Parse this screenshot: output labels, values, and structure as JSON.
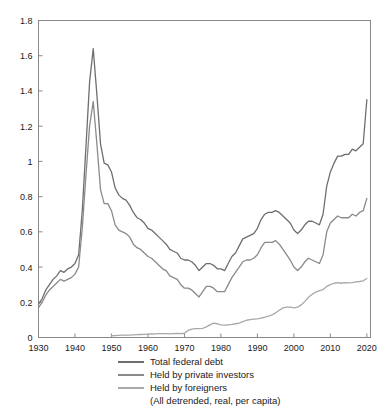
{
  "chart_data": {
    "type": "line",
    "title": "",
    "subtitle": "",
    "xlabel": "",
    "ylabel": "",
    "xlim": [
      1930,
      2021
    ],
    "ylim": [
      0,
      1.8
    ],
    "grid": false,
    "legend_position": "bottom",
    "xticks": [
      1930,
      1940,
      1950,
      1960,
      1970,
      1980,
      1990,
      2000,
      2010,
      2020
    ],
    "xtick_labels": [
      "1930",
      "1940",
      "1950",
      "1960",
      "1970",
      "1980",
      "1990",
      "2000",
      "2010",
      "2020"
    ],
    "yticks": [
      0,
      0.2,
      0.4,
      0.6,
      0.8,
      1,
      1.2,
      1.4,
      1.6,
      1.8
    ],
    "ytick_labels": [
      "0",
      "0.2",
      "0.4",
      "0.6",
      "0.8",
      "1",
      "1.2",
      "1.4",
      "1.6",
      "1.8"
    ],
    "annotation": "(All detrended, real, per capita)",
    "series": [
      {
        "name": "Total federal debt",
        "color": "#6e6e6e",
        "x": [
          1930,
          1931,
          1932,
          1933,
          1934,
          1935,
          1936,
          1937,
          1938,
          1939,
          1940,
          1941,
          1942,
          1943,
          1944,
          1945,
          1946,
          1947,
          1948,
          1949,
          1950,
          1951,
          1952,
          1953,
          1954,
          1955,
          1956,
          1957,
          1958,
          1959,
          1960,
          1961,
          1962,
          1963,
          1964,
          1965,
          1966,
          1967,
          1968,
          1969,
          1970,
          1971,
          1972,
          1973,
          1974,
          1975,
          1976,
          1977,
          1978,
          1979,
          1980,
          1981,
          1982,
          1983,
          1984,
          1985,
          1986,
          1987,
          1988,
          1989,
          1990,
          1991,
          1992,
          1993,
          1994,
          1995,
          1996,
          1997,
          1998,
          1999,
          2000,
          2001,
          2002,
          2003,
          2004,
          2005,
          2006,
          2007,
          2008,
          2009,
          2010,
          2011,
          2012,
          2013,
          2014,
          2015,
          2016,
          2017,
          2018,
          2019,
          2020
        ],
        "values": [
          0.19,
          0.22,
          0.27,
          0.3,
          0.33,
          0.35,
          0.38,
          0.37,
          0.39,
          0.4,
          0.42,
          0.47,
          0.72,
          1.08,
          1.45,
          1.64,
          1.38,
          1.1,
          0.99,
          0.98,
          0.94,
          0.85,
          0.81,
          0.79,
          0.78,
          0.75,
          0.71,
          0.68,
          0.67,
          0.65,
          0.62,
          0.61,
          0.59,
          0.57,
          0.55,
          0.53,
          0.5,
          0.49,
          0.48,
          0.45,
          0.44,
          0.44,
          0.43,
          0.41,
          0.38,
          0.4,
          0.42,
          0.42,
          0.41,
          0.39,
          0.39,
          0.38,
          0.42,
          0.46,
          0.48,
          0.52,
          0.56,
          0.57,
          0.58,
          0.59,
          0.62,
          0.67,
          0.7,
          0.71,
          0.71,
          0.72,
          0.71,
          0.69,
          0.67,
          0.65,
          0.61,
          0.59,
          0.61,
          0.64,
          0.66,
          0.66,
          0.65,
          0.64,
          0.7,
          0.86,
          0.94,
          0.99,
          1.03,
          1.03,
          1.04,
          1.04,
          1.07,
          1.06,
          1.08,
          1.1,
          1.35
        ]
      },
      {
        "name": "Held by private investors",
        "color": "#8a8a8a",
        "x": [
          1930,
          1931,
          1932,
          1933,
          1934,
          1935,
          1936,
          1937,
          1938,
          1939,
          1940,
          1941,
          1942,
          1943,
          1944,
          1945,
          1946,
          1947,
          1948,
          1949,
          1950,
          1951,
          1952,
          1953,
          1954,
          1955,
          1956,
          1957,
          1958,
          1959,
          1960,
          1961,
          1962,
          1963,
          1964,
          1965,
          1966,
          1967,
          1968,
          1969,
          1970,
          1971,
          1972,
          1973,
          1974,
          1975,
          1976,
          1977,
          1978,
          1979,
          1980,
          1981,
          1982,
          1983,
          1984,
          1985,
          1986,
          1987,
          1988,
          1989,
          1990,
          1991,
          1992,
          1993,
          1994,
          1995,
          1996,
          1997,
          1998,
          1999,
          2000,
          2001,
          2002,
          2003,
          2004,
          2005,
          2006,
          2007,
          2008,
          2009,
          2010,
          2011,
          2012,
          2013,
          2014,
          2015,
          2016,
          2017,
          2018,
          2019,
          2020
        ],
        "values": [
          0.17,
          0.2,
          0.24,
          0.27,
          0.29,
          0.31,
          0.33,
          0.32,
          0.33,
          0.34,
          0.36,
          0.4,
          0.62,
          0.92,
          1.2,
          1.34,
          1.1,
          0.84,
          0.76,
          0.76,
          0.72,
          0.64,
          0.61,
          0.6,
          0.59,
          0.57,
          0.53,
          0.51,
          0.5,
          0.48,
          0.46,
          0.45,
          0.43,
          0.41,
          0.39,
          0.38,
          0.35,
          0.34,
          0.33,
          0.3,
          0.28,
          0.28,
          0.27,
          0.25,
          0.23,
          0.26,
          0.29,
          0.29,
          0.28,
          0.26,
          0.26,
          0.26,
          0.3,
          0.34,
          0.37,
          0.4,
          0.43,
          0.44,
          0.44,
          0.45,
          0.47,
          0.51,
          0.54,
          0.54,
          0.54,
          0.55,
          0.53,
          0.5,
          0.47,
          0.44,
          0.4,
          0.38,
          0.4,
          0.43,
          0.45,
          0.44,
          0.43,
          0.42,
          0.47,
          0.6,
          0.65,
          0.67,
          0.69,
          0.68,
          0.68,
          0.68,
          0.7,
          0.69,
          0.71,
          0.72,
          0.79
        ]
      },
      {
        "name": "Held by foreigners",
        "color": "#a8a8a8",
        "x": [
          1950,
          1951,
          1952,
          1953,
          1954,
          1955,
          1956,
          1957,
          1958,
          1959,
          1960,
          1961,
          1962,
          1963,
          1964,
          1965,
          1966,
          1967,
          1968,
          1969,
          1970,
          1971,
          1972,
          1973,
          1974,
          1975,
          1976,
          1977,
          1978,
          1979,
          1980,
          1981,
          1982,
          1983,
          1984,
          1985,
          1986,
          1987,
          1988,
          1989,
          1990,
          1991,
          1992,
          1993,
          1994,
          1995,
          1996,
          1997,
          1998,
          1999,
          2000,
          2001,
          2002,
          2003,
          2004,
          2005,
          2006,
          2007,
          2008,
          2009,
          2010,
          2011,
          2012,
          2013,
          2014,
          2015,
          2016,
          2017,
          2018,
          2019,
          2020
        ],
        "values": [
          0.01,
          0.011,
          0.012,
          0.013,
          0.014,
          0.014,
          0.015,
          0.016,
          0.017,
          0.018,
          0.019,
          0.02,
          0.021,
          0.022,
          0.022,
          0.022,
          0.021,
          0.022,
          0.023,
          0.022,
          0.024,
          0.04,
          0.048,
          0.05,
          0.05,
          0.052,
          0.06,
          0.072,
          0.082,
          0.078,
          0.072,
          0.07,
          0.072,
          0.074,
          0.078,
          0.082,
          0.09,
          0.098,
          0.102,
          0.104,
          0.106,
          0.11,
          0.115,
          0.122,
          0.128,
          0.14,
          0.155,
          0.168,
          0.172,
          0.172,
          0.168,
          0.172,
          0.185,
          0.205,
          0.228,
          0.245,
          0.258,
          0.266,
          0.272,
          0.29,
          0.3,
          0.308,
          0.312,
          0.308,
          0.312,
          0.31,
          0.312,
          0.316,
          0.318,
          0.322,
          0.335
        ]
      }
    ]
  },
  "legend": {
    "items": [
      {
        "label": "Total federal debt",
        "color": "#6e6e6e"
      },
      {
        "label": "Held by private investors",
        "color": "#8a8a8a"
      },
      {
        "label": "Held by foreigners",
        "color": "#a8a8a8"
      }
    ],
    "note": "(All detrended, real, per capita)"
  },
  "axes": {
    "frame_color": "#888888",
    "tick_color": "#888888",
    "label_color": "#1a1a1a"
  }
}
